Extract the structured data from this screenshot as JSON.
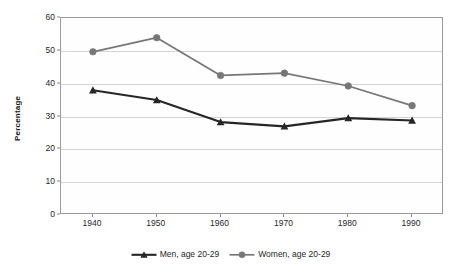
{
  "chart_data": {
    "type": "line",
    "title": "",
    "subtitle": "",
    "xlabel": "",
    "ylabel": "Percentage",
    "categories": [
      "1940",
      "1950",
      "1960",
      "1970",
      "1980",
      "1990"
    ],
    "x": [
      1940,
      1950,
      1960,
      1970,
      1980,
      1990
    ],
    "series": [
      {
        "name": "Men, age 20-29",
        "values": [
          38,
          35,
          28.3,
          27,
          29.5,
          28.8
        ],
        "color": "#262626",
        "marker": "triangle"
      },
      {
        "name": "Women, age 20-29",
        "values": [
          49.7,
          54,
          42.5,
          43.2,
          39.3,
          33.3
        ],
        "color": "#777777",
        "marker": "circle"
      }
    ],
    "ylim": [
      0,
      60
    ],
    "y_ticks": [
      0,
      10,
      20,
      30,
      40,
      50,
      60
    ],
    "y_tick_labels": [
      "0",
      "10",
      "20",
      "30",
      "40",
      "50",
      "60"
    ],
    "x_tick_labels": [
      "1940",
      "1950",
      "1960",
      "1970",
      "1980",
      "1990"
    ],
    "grid": "horizontal",
    "legend_position": "bottom",
    "plot_background": "#fefefe",
    "frame_color": "#9a9a9a",
    "gridline_color": "#d4d4d4"
  },
  "legend": {
    "entries": [
      {
        "label": "Men, age 20-29"
      },
      {
        "label": "Women, age 20-29"
      }
    ]
  },
  "axes": {
    "y_title": "Percentage"
  }
}
